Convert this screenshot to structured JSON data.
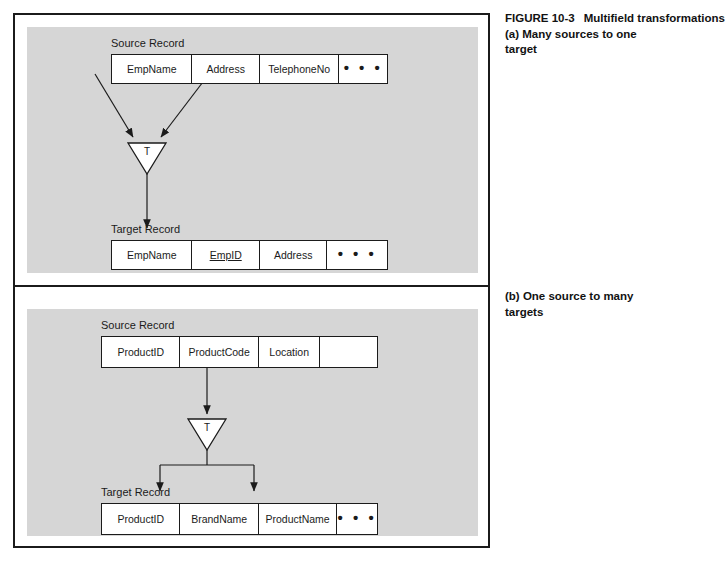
{
  "figure": {
    "number": "FIGURE 10-3",
    "title": "Multifield transformations",
    "caption_a": "(a) Many sources to one target",
    "caption_b": "(b) One source to many targets"
  },
  "colors": {
    "panel_background": "#d6d6d6",
    "frame_border": "#1b1b1b",
    "cell_background": "#ffffff",
    "text": "#1b1b1b",
    "page_background": "#ffffff"
  },
  "panel_a": {
    "source": {
      "label": "Source Record",
      "fields": [
        {
          "name": "EmpName",
          "underlined": false
        },
        {
          "name": "Address",
          "underlined": false
        },
        {
          "name": "TelephoneNo",
          "underlined": false
        },
        {
          "name": "• • •",
          "underlined": false
        }
      ]
    },
    "transform": {
      "label": "T",
      "shape": "inverted-triangle"
    },
    "target": {
      "label": "Target Record",
      "fields": [
        {
          "name": "EmpName",
          "underlined": false
        },
        {
          "name": "EmpID",
          "underlined": true
        },
        {
          "name": "Address",
          "underlined": false
        },
        {
          "name": "• • •",
          "underlined": false
        }
      ]
    },
    "flow": "many-to-one"
  },
  "panel_b": {
    "source": {
      "label": "Source Record",
      "fields": [
        {
          "name": "ProductID",
          "underlined": false
        },
        {
          "name": "ProductCode",
          "underlined": false
        },
        {
          "name": "Location",
          "underlined": false
        },
        {
          "name": "",
          "underlined": false
        }
      ]
    },
    "transform": {
      "label": "T",
      "shape": "inverted-triangle"
    },
    "target": {
      "label": "Target Record",
      "fields": [
        {
          "name": "ProductID",
          "underlined": false
        },
        {
          "name": "BrandName",
          "underlined": false
        },
        {
          "name": "ProductName",
          "underlined": false
        },
        {
          "name": "• • •",
          "underlined": false
        }
      ]
    },
    "flow": "one-to-many"
  }
}
